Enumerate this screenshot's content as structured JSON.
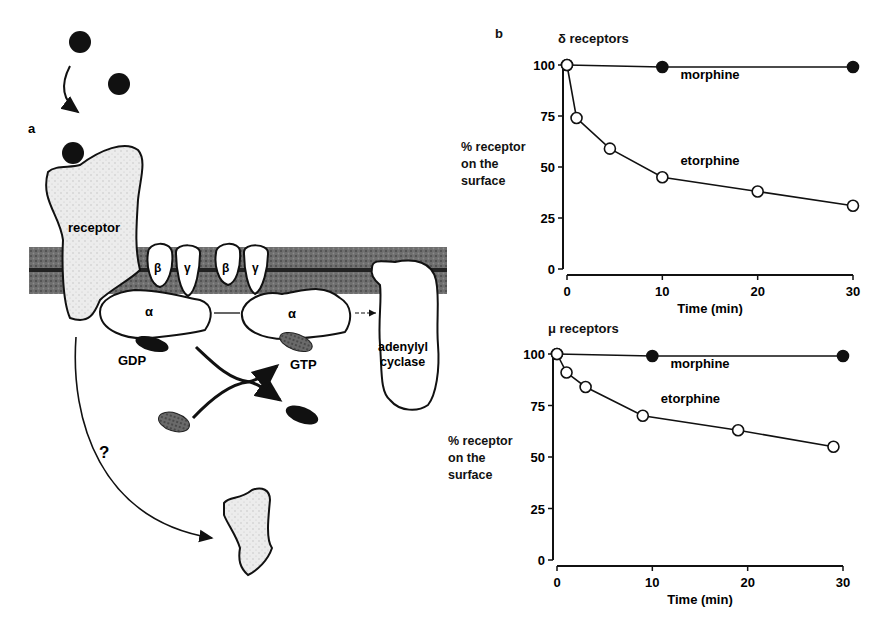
{
  "figure": {
    "panel_a": {
      "label": "a",
      "receptor_label": "receptor",
      "beta_label": "β",
      "gamma_label": "γ",
      "alpha_label": "α",
      "gdp_label": "GDP",
      "gtp_label": "GTP",
      "adenylyl_label_1": "adenylyl",
      "adenylyl_label_2": "cyclase",
      "question_label": "?"
    },
    "panel_b": {
      "label": "b"
    }
  },
  "chart_data": [
    {
      "type": "line",
      "title": "δ receptors",
      "xlabel": "Time (min)",
      "ylabel": "% receptor on the surface",
      "ylabel_lines": [
        "% receptor",
        "on the",
        "surface"
      ],
      "xlim": [
        0,
        30
      ],
      "ylim": [
        0,
        100
      ],
      "xticks": [
        0,
        10,
        20,
        30
      ],
      "yticks": [
        0,
        25,
        50,
        75,
        100
      ],
      "grid": false,
      "series": [
        {
          "name": "morphine",
          "marker": "filled-circle",
          "x": [
            0,
            10,
            30
          ],
          "y": [
            100,
            99,
            99
          ]
        },
        {
          "name": "etorphine",
          "marker": "open-circle",
          "x": [
            0,
            1,
            4.5,
            10,
            20,
            30
          ],
          "y": [
            100,
            74,
            59,
            45,
            38,
            31
          ]
        }
      ],
      "annotations": [
        {
          "text": "morphine",
          "x": 15,
          "y": 93
        },
        {
          "text": "etorphine",
          "x": 15,
          "y": 51
        }
      ]
    },
    {
      "type": "line",
      "title": "μ receptors",
      "xlabel": "Time (min)",
      "ylabel": "% receptor on the surface",
      "ylabel_lines": [
        "% receptor",
        "on the",
        "surface"
      ],
      "xlim": [
        0,
        30
      ],
      "ylim": [
        0,
        100
      ],
      "xticks": [
        0,
        10,
        20,
        30
      ],
      "yticks": [
        0,
        25,
        50,
        75,
        100
      ],
      "grid": false,
      "series": [
        {
          "name": "morphine",
          "marker": "filled-circle",
          "x": [
            0,
            10,
            30
          ],
          "y": [
            100,
            99,
            99
          ]
        },
        {
          "name": "etorphine",
          "marker": "open-circle",
          "x": [
            0,
            1,
            3,
            9,
            19,
            29
          ],
          "y": [
            100,
            91,
            84,
            70,
            63,
            55
          ]
        }
      ],
      "annotations": [
        {
          "text": "morphine",
          "x": 15,
          "y": 93
        },
        {
          "text": "etorphine",
          "x": 14,
          "y": 76
        }
      ]
    }
  ]
}
